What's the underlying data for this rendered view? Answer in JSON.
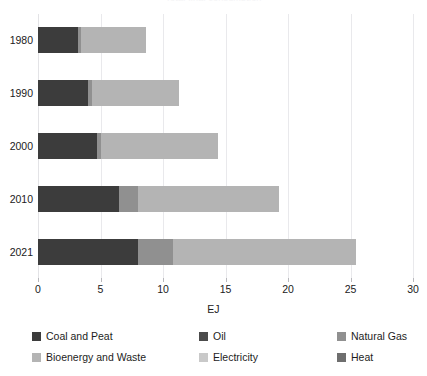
{
  "chart_data": {
    "type": "bar",
    "orientation": "horizontal",
    "stacked": true,
    "title": "",
    "xlabel": "EJ",
    "ylabel": "",
    "xlim": [
      0,
      30
    ],
    "xticks": [
      0,
      5,
      10,
      15,
      20,
      25,
      30
    ],
    "grid": true,
    "legend_position": "bottom",
    "categories": [
      "1980",
      "1990",
      "2000",
      "2010",
      "2021"
    ],
    "series": [
      {
        "name": "Coal and Peat",
        "color": "#3c3c3c",
        "values": [
          3.2,
          4.0,
          4.7,
          6.5,
          8.0
        ]
      },
      {
        "name": "Oil",
        "color": "#4b4b4b",
        "values": [
          0.0,
          0.0,
          0.0,
          0.0,
          0.0
        ]
      },
      {
        "name": "Natural Gas",
        "color": "#909090",
        "values": [
          0.2,
          0.3,
          0.3,
          1.5,
          2.8
        ]
      },
      {
        "name": "Bioenergy and Waste",
        "color": "#b4b4b4",
        "values": [
          5.2,
          7.0,
          9.4,
          11.3,
          14.6
        ]
      },
      {
        "name": "Electricity",
        "color": "#c9c9c9",
        "values": [
          0.0,
          0.0,
          0.0,
          0.0,
          0.0
        ]
      },
      {
        "name": "Heat",
        "color": "#6e6e6e",
        "values": [
          0.0,
          0.0,
          0.0,
          0.0,
          0.0
        ]
      }
    ],
    "totals": [
      8.6,
      11.3,
      14.4,
      19.3,
      25.4
    ]
  },
  "axes": {
    "x": {
      "title": "EJ",
      "ticks": [
        "0",
        "5",
        "10",
        "15",
        "20",
        "25",
        "30"
      ]
    },
    "y": {
      "ticks": [
        "1980",
        "1990",
        "2000",
        "2010",
        "2021"
      ]
    }
  },
  "legend": {
    "items": [
      {
        "label": "Coal and Peat",
        "color": "#3c3c3c"
      },
      {
        "label": "Oil",
        "color": "#4b4b4b"
      },
      {
        "label": "Natural Gas",
        "color": "#909090"
      },
      {
        "label": "Bioenergy and Waste",
        "color": "#b4b4b4"
      },
      {
        "label": "Electricity",
        "color": "#c9c9c9"
      },
      {
        "label": "Heat",
        "color": "#6e6e6e"
      }
    ]
  },
  "title": {
    "text": "Total final consumption"
  }
}
